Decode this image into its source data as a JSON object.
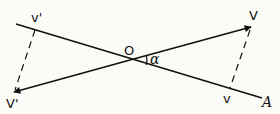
{
  "diagram": {
    "type": "vector-projection",
    "colors": {
      "line": "#111111",
      "background": "#fbfbf7"
    },
    "labels": {
      "v_prime_upper": "v'",
      "V_prime_lower": "V'",
      "origin": "O",
      "angle": "α",
      "V_upper": "V",
      "v_lower": "v",
      "axis_end": "A"
    },
    "elements": [
      {
        "name": "axis-line-OA",
        "from": [
          16,
          24
        ],
        "to": [
          262,
          98
        ],
        "style": "solid"
      },
      {
        "name": "vector-OV",
        "from": [
          130,
          60
        ],
        "to": [
          251,
          27
        ],
        "style": "solid-arrow"
      },
      {
        "name": "vector-OV-prime",
        "from": [
          130,
          60
        ],
        "to": [
          14,
          92
        ],
        "style": "solid-arrow"
      },
      {
        "name": "projection-V-to-v",
        "from": [
          251,
          27
        ],
        "to": [
          230,
          88
        ],
        "style": "dashed"
      },
      {
        "name": "projection-V-prime-to-v-prime",
        "from": [
          35,
          30
        ],
        "to": [
          14,
          92
        ],
        "style": "dashed"
      },
      {
        "name": "angle-arc-alpha",
        "center": [
          130,
          60
        ],
        "between": [
          "OV",
          "OA"
        ]
      }
    ]
  }
}
